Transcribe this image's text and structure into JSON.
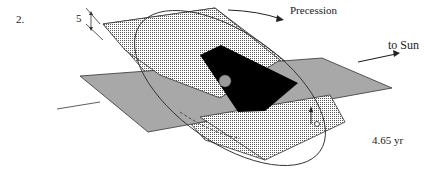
{
  "figure": {
    "number": "2.",
    "angle_label": "5",
    "precession_label": "Precession",
    "sun_label": "to Sun",
    "period_label": "4.65 yr"
  },
  "colors": {
    "ecliptic_plane": "#a8a8a8",
    "orbit_plane_dots": "#555555",
    "shadow_block": "#000000",
    "central_body": "#9a9a9a"
  }
}
